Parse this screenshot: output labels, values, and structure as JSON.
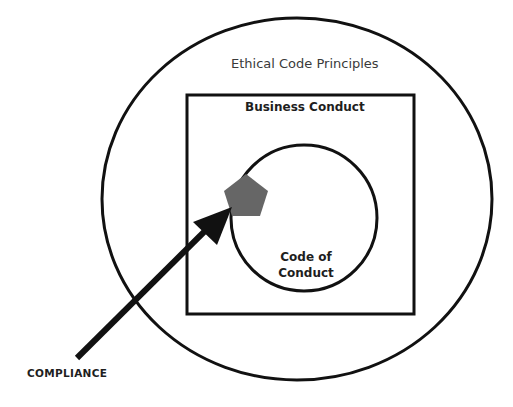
{
  "diagram": {
    "outer_circle": {
      "label": "Ethical Code Principles"
    },
    "square": {
      "label": "Business Conduct"
    },
    "inner_circle": {
      "label_line1": "Code of",
      "label_line2": "Conduct"
    },
    "pentagon": {
      "color": "#666666"
    },
    "arrow": {
      "label": "COMPLIANCE",
      "color": "#111111"
    }
  },
  "colors": {
    "stroke": "#111111",
    "background": "#ffffff",
    "pentagon": "#666666"
  }
}
